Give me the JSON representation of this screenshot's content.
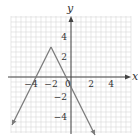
{
  "chart_data": {
    "type": "line",
    "title": "",
    "xlabel": "x",
    "ylabel": "y",
    "function": "y = -2|x + 2| + 3",
    "vertex": [
      -2,
      3
    ],
    "series": [
      {
        "name": "left-arm",
        "x": [
          -2,
          -5.9
        ],
        "y": [
          3,
          -4.8
        ]
      },
      {
        "name": "right-arm",
        "x": [
          -2,
          2.4
        ],
        "y": [
          3,
          -5.8
        ]
      }
    ],
    "x_intercepts": [
      -3.5,
      -0.5
    ],
    "xlim": [
      -6,
      6
    ],
    "ylim": [
      -5.5,
      6
    ],
    "xticks": [
      -4,
      -2,
      0,
      2,
      4
    ],
    "xtick_labels": [
      "−4",
      "−2",
      "0",
      "2",
      "4"
    ],
    "yticks": [
      4,
      2,
      -2,
      -4
    ],
    "ytick_labels": [
      "4",
      "2",
      "−2",
      "−4"
    ],
    "grid": true,
    "grid_step": 0.5,
    "legend": null,
    "colors": {
      "curve": "#7a7a7a",
      "axis": "#444444",
      "grid": "#d9d9d9"
    }
  },
  "axes": {
    "x_label": "x",
    "y_label": "y"
  }
}
